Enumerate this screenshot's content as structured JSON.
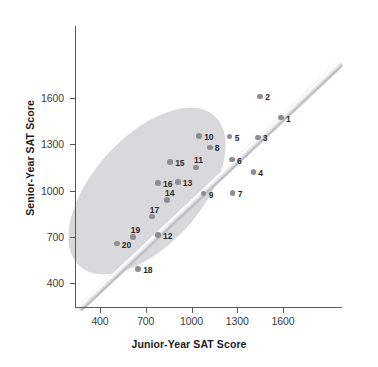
{
  "chart_data": {
    "type": "scatter",
    "title": "",
    "xlabel": "Junior-Year SAT Score",
    "ylabel": "Senior-Year SAT Score",
    "xlim": [
      270,
      1800
    ],
    "ylim": [
      250,
      1830
    ],
    "xticks": [
      400,
      700,
      1000,
      1300,
      1600
    ],
    "yticks": [
      400,
      700,
      1000,
      1300,
      1600
    ],
    "xtick_labels": [
      "400",
      "700",
      "1000",
      "1300",
      "1600"
    ],
    "ytick_labels": [
      "400",
      "700",
      "1000",
      "1300",
      "1600"
    ],
    "grid": false,
    "legend": null,
    "annotations": [
      {
        "name": "reference-line",
        "desc": "diagonal y = x reference band"
      },
      {
        "name": "correlation-ellipse",
        "desc": "shaded ellipse enclosing the point cloud, tilted along y = x"
      }
    ],
    "point_labels": [
      "1",
      "2",
      "3",
      "4",
      "5",
      "6",
      "7",
      "8",
      "9",
      "10",
      "11",
      "12",
      "13",
      "14",
      "15",
      "16",
      "17",
      "18",
      "19",
      "20"
    ],
    "x": [
      1587,
      1450,
      1435,
      1405,
      1250,
      1265,
      1270,
      1120,
      1080,
      1050,
      1030,
      780,
      910,
      840,
      860,
      780,
      740,
      650,
      615,
      510
    ],
    "y": [
      1473,
      1610,
      1345,
      1120,
      1350,
      1200,
      985,
      1280,
      980,
      1355,
      1150,
      710,
      1055,
      940,
      1185,
      1050,
      830,
      490,
      700,
      655
    ],
    "points": [
      {
        "label": "1",
        "x": 1587,
        "y": 1473
      },
      {
        "label": "2",
        "x": 1450,
        "y": 1610
      },
      {
        "label": "3",
        "x": 1435,
        "y": 1345
      },
      {
        "label": "4",
        "x": 1405,
        "y": 1120
      },
      {
        "label": "5",
        "x": 1250,
        "y": 1350
      },
      {
        "label": "6",
        "x": 1265,
        "y": 1200
      },
      {
        "label": "7",
        "x": 1270,
        "y": 985
      },
      {
        "label": "8",
        "x": 1120,
        "y": 1280
      },
      {
        "label": "9",
        "x": 1080,
        "y": 980
      },
      {
        "label": "10",
        "x": 1050,
        "y": 1355
      },
      {
        "label": "11",
        "x": 1030,
        "y": 1150
      },
      {
        "label": "12",
        "x": 780,
        "y": 710
      },
      {
        "label": "13",
        "x": 910,
        "y": 1055
      },
      {
        "label": "14",
        "x": 840,
        "y": 940
      },
      {
        "label": "15",
        "x": 860,
        "y": 1185
      },
      {
        "label": "16",
        "x": 780,
        "y": 1050
      },
      {
        "label": "17",
        "x": 740,
        "y": 830
      },
      {
        "label": "18",
        "x": 650,
        "y": 490
      },
      {
        "label": "19",
        "x": 615,
        "y": 700
      },
      {
        "label": "20",
        "x": 510,
        "y": 655
      }
    ]
  },
  "colors": {
    "point": "#8d8d92",
    "ellipse": "#d6d6d8",
    "axis": "#58585a",
    "text": "#1b1b1d",
    "tick_text": "#3a3a3c",
    "background": "#ffffff"
  }
}
